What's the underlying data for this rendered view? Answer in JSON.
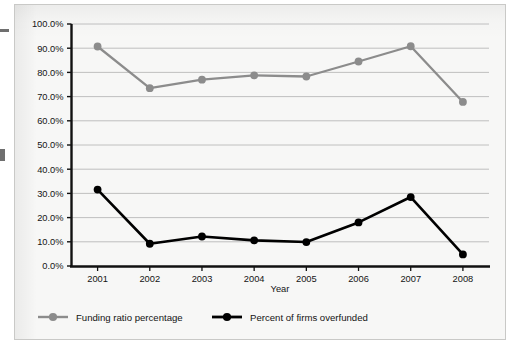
{
  "chart_data": {
    "type": "line",
    "title": "",
    "xlabel": "Year",
    "ylabel": "",
    "categories": [
      "2001",
      "2002",
      "2003",
      "2004",
      "2005",
      "2006",
      "2007",
      "2008"
    ],
    "series": [
      {
        "name": "Funding ratio percentage",
        "color": "#8c8c8c",
        "marker": "circle",
        "values": [
          90.7,
          73.5,
          77.0,
          78.8,
          78.3,
          84.5,
          90.8,
          67.8
        ]
      },
      {
        "name": "Percent of firms overfunded",
        "color": "#000000",
        "marker": "circle",
        "values": [
          31.6,
          9.2,
          12.2,
          10.6,
          9.9,
          18.0,
          28.5,
          4.8
        ]
      }
    ],
    "ylim": [
      0,
      100
    ],
    "ytick_labels": [
      "100.0%",
      "90.0%",
      "80.0%",
      "70.0%",
      "60.0%",
      "50.0%",
      "40.0%",
      "30.0%",
      "20.0%",
      "10.0%",
      "0.0%"
    ],
    "ytick_values": [
      100,
      90,
      80,
      70,
      60,
      50,
      40,
      30,
      20,
      10,
      0
    ],
    "grid": true,
    "grid_axis": "y",
    "legend_position": "bottom",
    "value_format": "percent-one-decimal"
  },
  "legend": {
    "items": [
      {
        "label": "Funding ratio percentage",
        "color": "#8c8c8c"
      },
      {
        "label": "Percent of firms overfunded",
        "color": "#000000"
      }
    ]
  },
  "axes": {
    "x_title": "Year"
  }
}
